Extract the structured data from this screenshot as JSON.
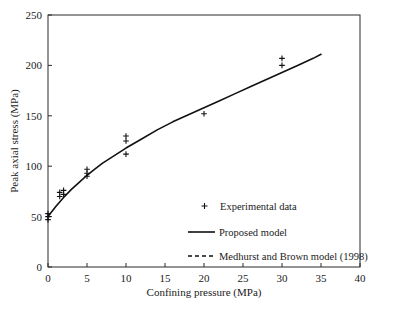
{
  "chart_data": {
    "type": "scatter",
    "title": "",
    "xlabel": "Confining pressure (MPa)",
    "ylabel": "Peak axial stress (MPa)",
    "xlim": [
      0,
      40
    ],
    "ylim": [
      0,
      250
    ],
    "xticks": [
      0,
      5,
      10,
      15,
      20,
      25,
      30,
      35,
      40
    ],
    "yticks": [
      0,
      50,
      100,
      150,
      200,
      250
    ],
    "xtick_labels": [
      "0",
      "5",
      "10",
      "15",
      "20",
      "25",
      "30",
      "35",
      "40"
    ],
    "ytick_labels": [
      "0",
      "50",
      "100",
      "150",
      "200",
      "250"
    ],
    "grid": false,
    "legend_position": "center",
    "series": [
      {
        "name": "Experimental data",
        "type": "scatter",
        "marker": "plus",
        "color": "#111111",
        "points": [
          [
            0,
            47
          ],
          [
            0,
            50
          ],
          [
            0,
            53
          ],
          [
            1.5,
            70
          ],
          [
            1.5,
            74
          ],
          [
            2.0,
            72
          ],
          [
            2.0,
            76
          ],
          [
            5,
            90
          ],
          [
            5,
            93
          ],
          [
            5,
            97
          ],
          [
            10,
            112
          ],
          [
            10,
            125
          ],
          [
            10,
            130
          ],
          [
            20,
            152
          ],
          [
            30,
            200
          ],
          [
            30,
            207
          ]
        ]
      },
      {
        "name": "Proposed model",
        "type": "line",
        "style": "solid",
        "color": "#111111",
        "x": [
          0,
          1,
          2,
          3,
          4,
          5,
          6,
          7,
          8,
          9,
          10,
          12,
          14,
          16,
          18,
          20,
          22,
          24,
          26,
          28,
          30,
          32,
          34,
          35
        ],
        "y": [
          50,
          60,
          69,
          77,
          84,
          91,
          97,
          103,
          108,
          113,
          118,
          127,
          136,
          144,
          151,
          158,
          165,
          172,
          179,
          186,
          193,
          200,
          207,
          211
        ]
      },
      {
        "name": "Medhurst and Brown model (1998)",
        "type": "line",
        "style": "dashed",
        "color": "#111111",
        "x": [],
        "y": []
      }
    ]
  },
  "legend": {
    "entries": [
      {
        "label": "Experimental data",
        "marker": "plus"
      },
      {
        "label": "Proposed model",
        "marker": "solid-line"
      },
      {
        "label": "Medhurst and Brown model (1998)",
        "marker": "dashed-line"
      }
    ]
  }
}
